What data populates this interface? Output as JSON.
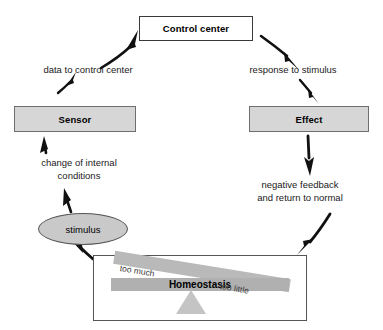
{
  "diagram": {
    "nodes": {
      "control_center": "Control center",
      "sensor": "Sensor",
      "effect": "Effect",
      "stimulus": "stimulus"
    },
    "edge_labels": {
      "data_to_control": "data to control center",
      "response_to_stimulus": "response to stimulus",
      "change_of_internal": "change of internal\nconditions",
      "negative_feedback": "negative feedback\nand return to normal"
    },
    "balance_panel": {
      "center_label": "Homeostasis",
      "left_label": "too much",
      "right_label": "too little"
    },
    "colors": {
      "box_gray_fill": "#d6d6d6",
      "box_white_fill": "#ffffff",
      "box_border": "#555555",
      "stimulus_fill": "#c9c9c9",
      "beam_fill": "#b9b9b9",
      "fulcrum_fill": "#c4c4c4",
      "arrow_stroke": "#111111",
      "text": "#1a1a1a"
    }
  }
}
